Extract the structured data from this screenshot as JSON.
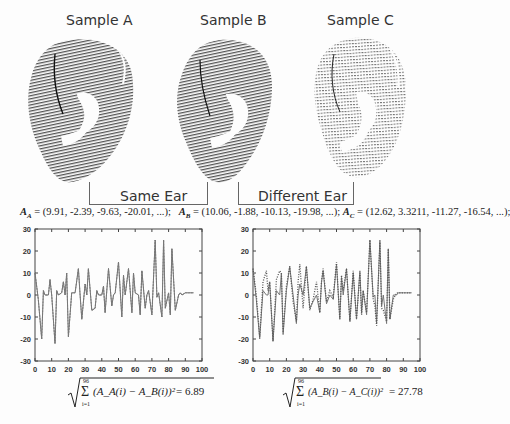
{
  "samples": [
    {
      "label": "Sample A",
      "style": "dense-dark"
    },
    {
      "label": "Sample B",
      "style": "dense-dark"
    },
    {
      "label": "Sample C",
      "style": "sparse-light"
    }
  ],
  "brackets": {
    "same": "Same Ear",
    "different": "Different Ear"
  },
  "vectors": {
    "a": {
      "name": "A",
      "sub": "A",
      "values": "= (9.91, -2.39, -9.63, -20.01, ...);"
    },
    "b": {
      "name": "A",
      "sub": "B",
      "values": "= (10.06, -1.88, -10.13, -19.98, ...);"
    },
    "c": {
      "name": "A",
      "sub": "C",
      "values": "= (12.62, 3.3211, -11.27, -16.54, ...);"
    }
  },
  "formulas": {
    "left": {
      "upper": "96",
      "lower": "i=1",
      "body": "(A_A(i) − A_B(i))²",
      "result": "= 6.89"
    },
    "right": {
      "upper": "96",
      "lower": "i=1",
      "body": "(A_B(i) − A_C(i))²",
      "result": "= 27.78"
    }
  },
  "colors": {
    "line": "#777777",
    "axis": "#444444",
    "text": "#222222"
  },
  "chart_data": [
    {
      "type": "line",
      "title": "Sample A vs Sample B (Same Ear)",
      "xlabel": "",
      "ylabel": "",
      "xlim": [
        0,
        100
      ],
      "ylim": [
        -30,
        30
      ],
      "xticks": [
        0,
        10,
        20,
        30,
        40,
        50,
        60,
        70,
        80,
        90,
        100
      ],
      "yticks": [
        -30,
        -20,
        -10,
        0,
        10,
        20,
        30
      ],
      "grid": false,
      "series": [
        {
          "name": "A_A",
          "style": "solid",
          "x": [
            0,
            2,
            4,
            5,
            6,
            8,
            9,
            10,
            12,
            13,
            14,
            16,
            17,
            18,
            19,
            20,
            22,
            24,
            26,
            27,
            28,
            30,
            31,
            32,
            34,
            36,
            37,
            38,
            40,
            41,
            42,
            44,
            46,
            47,
            48,
            50,
            52,
            53,
            54,
            56,
            58,
            59,
            60,
            62,
            63,
            64,
            66,
            67,
            68,
            70,
            72,
            73,
            74,
            76,
            77,
            78,
            80,
            81,
            82,
            84,
            86,
            87,
            88,
            90,
            91,
            92,
            94,
            95
          ],
          "y": [
            10,
            -2,
            -20,
            2,
            0,
            0,
            7,
            0,
            -22,
            2,
            0,
            1,
            6,
            0,
            10,
            -19,
            1,
            1,
            12,
            0,
            -11,
            5,
            0,
            12,
            -7,
            -6,
            2,
            0,
            0,
            4,
            -8,
            12,
            -5,
            0,
            1,
            15,
            -10,
            9,
            0,
            12,
            -8,
            10,
            1,
            0,
            -9,
            11,
            -6,
            0,
            2,
            -9,
            25,
            -1,
            1,
            -10,
            25,
            -6,
            1,
            -9,
            21,
            -7,
            0,
            1,
            0,
            1,
            1,
            1,
            1,
            1
          ]
        },
        {
          "name": "A_B",
          "style": "dashed",
          "x": [
            0,
            2,
            4,
            5,
            6,
            8,
            9,
            10,
            12,
            13,
            14,
            16,
            17,
            18,
            19,
            20,
            22,
            24,
            26,
            27,
            28,
            30,
            31,
            32,
            34,
            36,
            37,
            38,
            40,
            41,
            42,
            44,
            46,
            47,
            48,
            50,
            52,
            53,
            54,
            56,
            58,
            59,
            60,
            62,
            63,
            64,
            66,
            67,
            68,
            70,
            72,
            73,
            74,
            76,
            77,
            78,
            80,
            81,
            82,
            84,
            86,
            87,
            88,
            90,
            91,
            92,
            94,
            95
          ],
          "y": [
            10,
            -2,
            -20,
            2,
            0,
            0,
            7,
            0,
            -22,
            2,
            0,
            1,
            6,
            0,
            10,
            -19,
            1,
            1,
            12,
            0,
            -11,
            5,
            0,
            12,
            -7,
            -6,
            2,
            0,
            0,
            4,
            -8,
            12,
            -5,
            0,
            1,
            15,
            -10,
            9,
            0,
            12,
            -8,
            10,
            1,
            0,
            -9,
            11,
            -6,
            0,
            2,
            -9,
            25,
            -1,
            1,
            -10,
            25,
            -6,
            1,
            -9,
            21,
            -7,
            0,
            1,
            0,
            1,
            1,
            1,
            1,
            1
          ]
        }
      ]
    },
    {
      "type": "line",
      "title": "Sample B vs Sample C (Different Ear)",
      "xlabel": "",
      "ylabel": "",
      "xlim": [
        0,
        100
      ],
      "ylim": [
        -30,
        30
      ],
      "xticks": [
        0,
        10,
        20,
        30,
        40,
        50,
        60,
        70,
        80,
        90,
        100
      ],
      "yticks": [
        -30,
        -20,
        -10,
        0,
        10,
        20,
        30
      ],
      "grid": false,
      "series": [
        {
          "name": "A_B",
          "style": "solid",
          "x": [
            0,
            2,
            4,
            6,
            8,
            9,
            10,
            12,
            14,
            16,
            17,
            18,
            20,
            22,
            24,
            26,
            27,
            28,
            30,
            32,
            34,
            36,
            38,
            40,
            41,
            42,
            44,
            46,
            48,
            50,
            52,
            53,
            54,
            56,
            58,
            60,
            62,
            64,
            65,
            66,
            68,
            70,
            72,
            73,
            74,
            76,
            77,
            78,
            80,
            81,
            82,
            84,
            86,
            87,
            88,
            90,
            92,
            95
          ],
          "y": [
            12,
            -2,
            -20,
            2,
            0,
            0,
            6,
            -21,
            2,
            0,
            10,
            -18,
            2,
            13,
            0,
            -13,
            0,
            5,
            0,
            13,
            -6,
            -3,
            0,
            -8,
            6,
            11,
            -4,
            0,
            -2,
            14,
            -11,
            8,
            0,
            12,
            -12,
            10,
            -11,
            11,
            -8,
            2,
            -9,
            25,
            -1,
            0,
            -13,
            25,
            -5,
            0,
            -13,
            21,
            -11,
            0,
            0,
            1,
            1,
            1,
            1,
            1
          ]
        },
        {
          "name": "A_C",
          "style": "dotted",
          "x": [
            0,
            2,
            4,
            6,
            8,
            9,
            10,
            12,
            14,
            16,
            17,
            18,
            20,
            22,
            24,
            26,
            27,
            28,
            30,
            32,
            34,
            36,
            38,
            40,
            41,
            42,
            44,
            46,
            48,
            50,
            52,
            53,
            54,
            56,
            58,
            60,
            62,
            64,
            65,
            66,
            68,
            70,
            72,
            73,
            74,
            76,
            77,
            78,
            80,
            81,
            82,
            84,
            86,
            87,
            88,
            90,
            92,
            95
          ],
          "y": [
            12,
            0,
            -19,
            6,
            11,
            2,
            6,
            -21,
            7,
            11,
            10,
            -17,
            4,
            13,
            -3,
            -12,
            6,
            14,
            -6,
            13,
            -7,
            -2,
            6,
            -8,
            6,
            12,
            -3,
            2,
            -1,
            15,
            -11,
            9,
            2,
            12,
            -12,
            11,
            -11,
            10,
            -9,
            2,
            -8,
            25,
            -2,
            -5,
            -14,
            24,
            -6,
            -7,
            -12,
            21,
            -11,
            -2,
            1,
            1,
            1,
            1,
            1,
            1
          ]
        }
      ]
    }
  ]
}
